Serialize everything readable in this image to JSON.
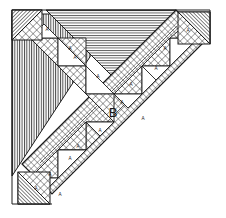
{
  "figure": {
    "background_color": "#ffffff",
    "ink_color": "#1c1c1c",
    "width": 226,
    "height": 218,
    "style": "engraving line-hatch"
  },
  "labels": {
    "band_label": "B",
    "sawtooth_label": "A"
  },
  "regions": [
    {
      "name": "left-vertical-hatch-triangle",
      "hatch": "vertical",
      "label": ""
    },
    {
      "name": "top-horizontal-hatch-triangle",
      "hatch": "horizontal",
      "label": ""
    },
    {
      "name": "diagonal-crosshatch-band",
      "hatch": "crosshatch",
      "label": "B"
    },
    {
      "name": "corner-square-top-left",
      "hatch": "diagonal-and-crosshatch",
      "label": ""
    },
    {
      "name": "corner-square-top-right",
      "hatch": "diagonal-and-crosshatch",
      "label": ""
    },
    {
      "name": "corner-square-bottom-left",
      "hatch": "diagonal-and-crosshatch",
      "label": ""
    }
  ],
  "sawtooth_upper": [
    {
      "label": "A"
    },
    {
      "label": "A"
    },
    {
      "label": "A"
    },
    {
      "label": "A"
    },
    {
      "label": "A"
    },
    {
      "label": "A"
    },
    {
      "label": "A"
    },
    {
      "label": "A"
    }
  ],
  "sawtooth_lower": [
    {
      "label": "A"
    },
    {
      "label": "A"
    },
    {
      "label": "A"
    },
    {
      "label": "A"
    },
    {
      "label": "A"
    },
    {
      "label": "A"
    },
    {
      "label": "A"
    },
    {
      "label": "A"
    }
  ],
  "colors": {
    "ink": "#1c1c1c",
    "hatch_light": "#3a3a3a",
    "paper": "#ffffff"
  }
}
